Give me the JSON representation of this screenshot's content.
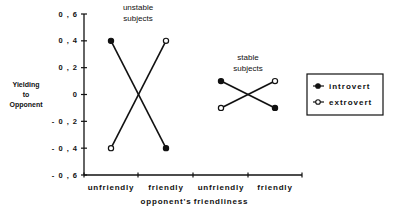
{
  "chart_data": {
    "type": "line",
    "title": "",
    "xlabel": "opponent's friendliness",
    "ylabel": "Yielding to Opponent",
    "ylabel_lines": [
      "Yielding",
      "to",
      "Opponent"
    ],
    "ylim": [
      -0.6,
      0.6
    ],
    "yticks": [
      0.6,
      0.4,
      0.2,
      0,
      -0.2,
      -0.4,
      -0.6
    ],
    "ytick_labels": [
      "0 , 6",
      "0 , 4",
      "0 , 2",
      "0",
      "- 0 , 2",
      "- 0 , 4",
      "- 0 , 6"
    ],
    "categories": [
      "unfriendly",
      "friendly",
      "unfriendly",
      "friendly"
    ],
    "groups": [
      {
        "label_lines": [
          "unstable",
          "subjects"
        ],
        "categories": [
          "unfriendly",
          "friendly"
        ]
      },
      {
        "label_lines": [
          "stable",
          "subjects"
        ],
        "categories": [
          "unfriendly",
          "friendly"
        ]
      }
    ],
    "series": [
      {
        "name": "introvert",
        "marker": "filled-circle",
        "groups": [
          {
            "group": "unstable subjects",
            "values": [
              0.4,
              -0.4
            ]
          },
          {
            "group": "stable subjects",
            "values": [
              0.1,
              -0.1
            ]
          }
        ]
      },
      {
        "name": "extrovert",
        "marker": "open-circle",
        "groups": [
          {
            "group": "unstable subjects",
            "values": [
              -0.4,
              0.4
            ]
          },
          {
            "group": "stable subjects",
            "values": [
              -0.1,
              0.1
            ]
          }
        ]
      }
    ],
    "grid": false,
    "legend_position": "right"
  }
}
